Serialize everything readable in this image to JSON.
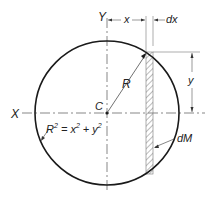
{
  "diagram": {
    "labels": {
      "y_axis": "Y",
      "x_axis": "X",
      "centroid": "C",
      "radius": "R",
      "x_dim": "x",
      "dx_dim": "dx",
      "y_dim": "y",
      "element": "dM",
      "eq_R": "R",
      "eq_sup1": "2",
      "eq_mid": " = x",
      "eq_sup2": "2",
      "eq_plus": " + y",
      "eq_sup3": "2"
    },
    "colors": {
      "stroke": "#1a1a1a",
      "thin": "#555555",
      "hatch": "#777777"
    }
  }
}
